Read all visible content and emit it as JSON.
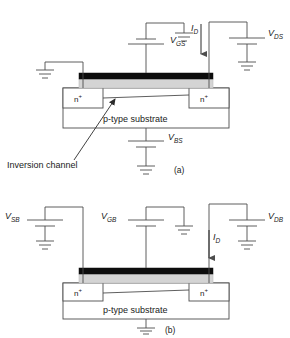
{
  "figure": {
    "colors": {
      "line": "#4d4d4d",
      "text": "#1a1a1a",
      "gate_metal": "#0d0d0d",
      "gate_oxide": "#d4d4d4",
      "body_fill": "#ffffff"
    },
    "panels": [
      {
        "id": "a",
        "caption": "(a)",
        "substrate_label": "p-type substrate",
        "source_region_label": "n",
        "source_region_sup": "+",
        "drain_region_label": "n",
        "drain_region_sup": "+",
        "annotation": "Inversion channel",
        "sources": [
          {
            "name": "gate-source-supply",
            "symbol": "V",
            "sub": "GS"
          },
          {
            "name": "drain-source-supply",
            "symbol": "V",
            "sub": "DS"
          },
          {
            "name": "body-source-supply",
            "symbol": "V",
            "sub": "BS"
          }
        ],
        "current": {
          "symbol": "I",
          "sub": "D",
          "direction": "down"
        },
        "grounds": 4
      },
      {
        "id": "b",
        "caption": "(b)",
        "substrate_label": "p-type substrate",
        "source_region_label": "n",
        "source_region_sup": "+",
        "drain_region_label": "n",
        "drain_region_sup": "+",
        "sources": [
          {
            "name": "source-body-supply",
            "symbol": "V",
            "sub": "SB"
          },
          {
            "name": "gate-body-supply",
            "symbol": "V",
            "sub": "GB"
          },
          {
            "name": "drain-body-supply",
            "symbol": "V",
            "sub": "DB"
          }
        ],
        "current": {
          "symbol": "I",
          "sub": "D",
          "direction": "down"
        },
        "grounds": 3
      }
    ]
  },
  "labels": {
    "vgs_v": "V",
    "vgs_sub": "GS",
    "vds_v": "V",
    "vds_sub": "DS",
    "vbs_v": "V",
    "vbs_sub": "BS",
    "vsb_v": "V",
    "vsb_sub": "SB",
    "vgb_v": "V",
    "vgb_sub": "GB",
    "vdb_v": "V",
    "vdb_sub": "DB",
    "id_a_i": "I",
    "id_a_sub": "D",
    "id_b_i": "I",
    "id_b_sub": "D",
    "ptype_a": "p-type substrate",
    "ptype_b": "p-type substrate",
    "nplus_a_left": "n",
    "nplus_a_left_sup": "+",
    "nplus_a_right": "n",
    "nplus_a_right_sup": "+",
    "nplus_b_left": "n",
    "nplus_b_left_sup": "+",
    "nplus_b_right": "n",
    "nplus_b_right_sup": "+",
    "inversion": "Inversion channel",
    "panel_a": "(a)",
    "panel_b": "(b)"
  }
}
